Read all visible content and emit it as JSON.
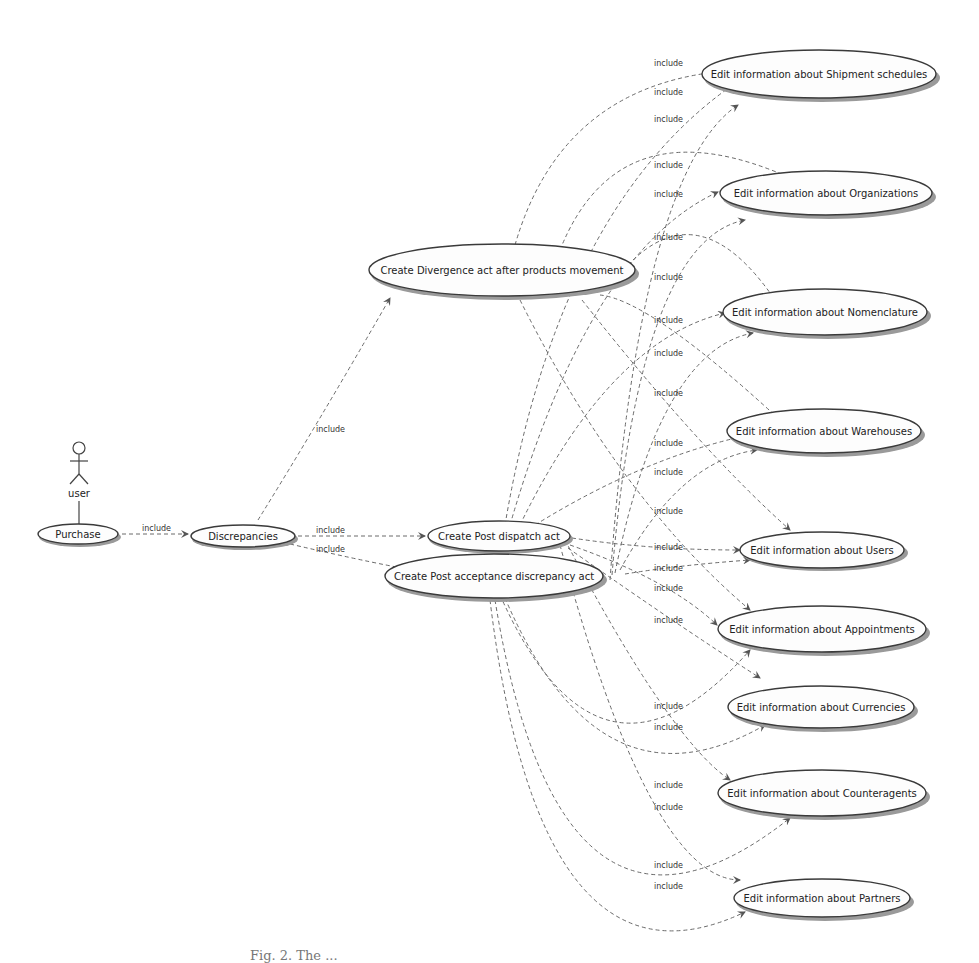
{
  "diagram": {
    "type": "UML use case diagram",
    "actor": {
      "label": "user"
    },
    "edge_label": "include",
    "use_cases": {
      "purchase": "Purchase",
      "discrepancies": "Discrepancies",
      "divergence": "Create Divergence act after products movement",
      "post_dispatch": "Create Post dispatch act",
      "post_acceptance": "Create Post acceptance discrepancy act",
      "shipment": "Edit information about Shipment schedules",
      "organizations": "Edit information about Organizations",
      "nomenclature": "Edit information about Nomenclature",
      "warehouses": "Edit information about Warehouses",
      "users": "Edit information about Users",
      "appointments": "Edit information about Appointments",
      "currencies": "Edit information about Currencies",
      "counteragents": "Edit information about Counteragents",
      "partners": "Edit information about Partners"
    }
  },
  "caption": "Fig. 2. The ..."
}
